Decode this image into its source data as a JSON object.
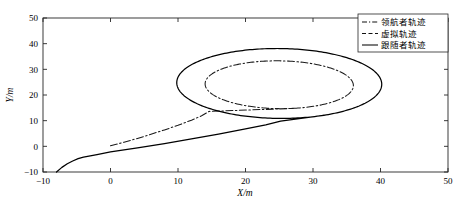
{
  "chart_data": {
    "type": "line",
    "title": "",
    "xlabel": "X/m",
    "ylabel": "Y/m",
    "xlim": [
      -10,
      50
    ],
    "ylim": [
      -10,
      50
    ],
    "xticks": [
      -10,
      0,
      10,
      20,
      30,
      40,
      50
    ],
    "yticks": [
      -10,
      0,
      10,
      20,
      30,
      40,
      50
    ],
    "xtick_labels": [
      "−10",
      "0",
      "10",
      "20",
      "30",
      "40",
      "50"
    ],
    "ytick_labels": [
      "−10",
      "0",
      "10",
      "20",
      "30",
      "40",
      "50"
    ],
    "grid": false,
    "box": true,
    "legend_position": "upper-right-inside",
    "series": [
      {
        "name": "领航者轨迹",
        "style": "dash-dot",
        "color": "#1a1a1a",
        "approach_points": [
          [
            0.0,
            0.2
          ],
          [
            2.0,
            1.6
          ],
          [
            4.0,
            3.1
          ],
          [
            6.0,
            4.7
          ],
          [
            8.0,
            6.4
          ],
          [
            10.0,
            8.2
          ],
          [
            12.0,
            10.2
          ],
          [
            13.5,
            11.9
          ],
          [
            14.6,
            13.6
          ]
        ],
        "loop": {
          "shape": "ellipse",
          "center": [
            25.0,
            24.0
          ],
          "rx": 11.0,
          "ry": 9.3,
          "rotation_deg": -6
        }
      },
      {
        "name": "虚拟轨迹",
        "style": "dashed",
        "color": "#1a1a1a",
        "note": "overlaps leader trajectory"
      },
      {
        "name": "跟随者轨迹",
        "style": "solid",
        "color": "#000000",
        "approach_points": [
          [
            -8.0,
            -10.0
          ],
          [
            -7.2,
            -8.2
          ],
          [
            -6.4,
            -6.8
          ],
          [
            -5.6,
            -5.7
          ],
          [
            -4.8,
            -4.8
          ],
          [
            -4.0,
            -4.2
          ],
          [
            -2.0,
            -3.2
          ],
          [
            0.0,
            -2.2
          ],
          [
            4.0,
            -0.6
          ],
          [
            8.0,
            1.1
          ],
          [
            12.0,
            2.9
          ],
          [
            16.0,
            4.8
          ],
          [
            20.0,
            6.8
          ],
          [
            23.0,
            8.4
          ],
          [
            25.2,
            9.8
          ]
        ],
        "loop": {
          "shape": "ellipse",
          "center": [
            25.0,
            24.5
          ],
          "rx": 15.2,
          "ry": 13.6,
          "rotation_deg": -6
        }
      }
    ]
  },
  "legend": {
    "items": [
      {
        "label": "领航者轨迹",
        "style": "dash-dot"
      },
      {
        "label": "虚拟轨迹",
        "style": "dashed"
      },
      {
        "label": "跟随者轨迹",
        "style": "solid"
      }
    ]
  },
  "axes": {
    "x_title": "X/m",
    "y_title": "Y/m"
  }
}
